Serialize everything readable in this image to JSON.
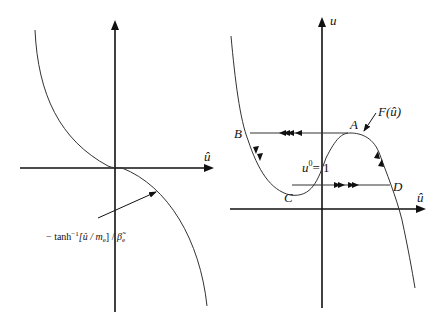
{
  "left_panel": {
    "x_axis_label": "û",
    "curve_label": "− tanh⁻¹[û / mₑ] / β̃ₑ",
    "curve_label_parts": {
      "prefix": "− tanh",
      "sup": "−1",
      "mid": "[û / m",
      "sub1": "e",
      "mid2": "] / ",
      "beta": "β̃",
      "sub2": "e"
    }
  },
  "right_panel": {
    "y_axis_label": "u",
    "x_axis_label": "û",
    "curve_label": "F(û)",
    "points": {
      "A": "A",
      "B": "B",
      "C": "C",
      "D": "D"
    },
    "equilibrium_label": "u",
    "equilibrium_sup": "0",
    "equilibrium_rest": "= 1"
  },
  "colors": {
    "line": "#111111",
    "background": "#ffffff"
  }
}
